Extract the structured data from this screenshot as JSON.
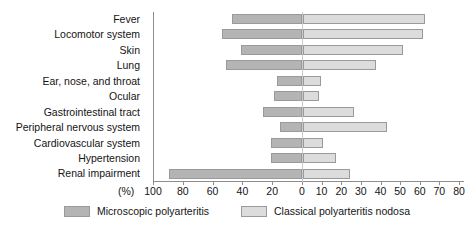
{
  "chart_data": {
    "type": "bar",
    "orientation": "horizontal",
    "style": "diverging-bidirectional",
    "title": "",
    "xlabel": "(%)",
    "ylabel": "",
    "grid": false,
    "legend_position": "bottom-center",
    "categories": [
      "Fever",
      "Locomotor system",
      "Skin",
      "Lung",
      "Ear, nose, and throat",
      "Ocular",
      "Gastrointestinal tract",
      "Peripheral nervous system",
      "Cardiovascular system",
      "Hypertension",
      "Renal impairment"
    ],
    "series": [
      {
        "name": "Microscopic polyarteritis",
        "side": "left",
        "color": "#b4b4b4",
        "axis_range": [
          0,
          100
        ],
        "values": [
          47,
          54,
          41,
          51,
          17,
          19,
          26,
          15,
          21,
          21,
          89
        ]
      },
      {
        "name": "Classical polyarteritis nodosa",
        "side": "right",
        "color": "#dcdcdc",
        "axis_range": [
          0,
          80
        ],
        "values": [
          62,
          61,
          51,
          37,
          9,
          8,
          26,
          43,
          10,
          17,
          24
        ]
      }
    ],
    "left_axis_ticks": [
      100,
      80,
      60,
      40,
      20,
      0
    ],
    "right_axis_ticks": [
      0,
      10,
      20,
      30,
      40,
      50,
      60,
      70,
      80
    ],
    "left_axis_max": 100,
    "right_axis_max": 80
  },
  "axis": {
    "unit_label": "(%)"
  },
  "legend": {
    "items": [
      {
        "label": "Microscopic polyarteritis",
        "swatch": "s-left"
      },
      {
        "label": "Classical polyarteritis nodosa",
        "swatch": "s-right"
      }
    ]
  }
}
